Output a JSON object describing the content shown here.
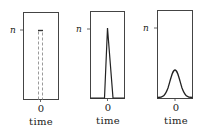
{
  "panels": [
    {
      "id": "rect-pulse",
      "y_label": "n",
      "x_tick": "0",
      "x_label": "time",
      "shape": "dashed-rectangle"
    },
    {
      "id": "narrow-spike",
      "y_label": "n",
      "x_tick": "0",
      "x_label": "time",
      "shape": "narrow-triangle"
    },
    {
      "id": "gaussian",
      "y_label": "n",
      "x_tick": "0",
      "x_label": "time",
      "shape": "gaussian-bump"
    }
  ],
  "colors": {
    "stroke": "#333333",
    "dashed": "#9a9a9a",
    "background": "#ffffff"
  }
}
